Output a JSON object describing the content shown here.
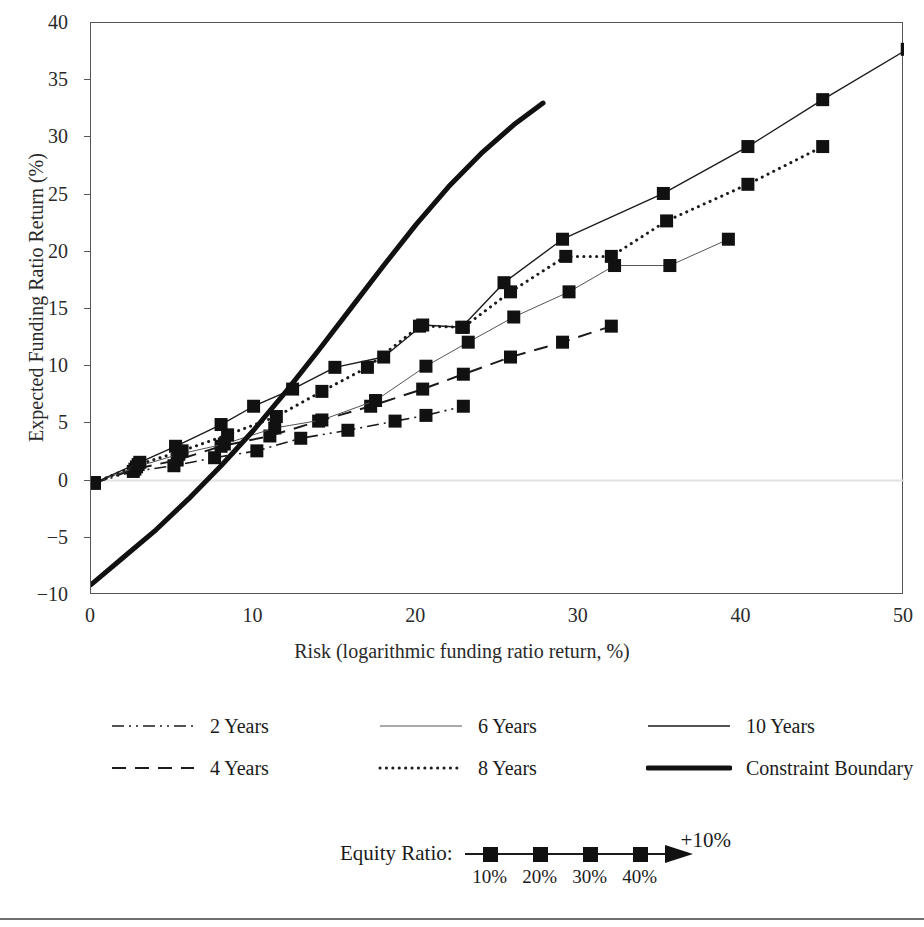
{
  "chart_data": {
    "type": "line",
    "title": "",
    "xlabel": "Risk (logarithmic funding ratio return, %)",
    "ylabel": "Expected Funding Ratio Return (%)",
    "xlim": [
      0,
      50
    ],
    "ylim": [
      -10,
      40
    ],
    "xticks": [
      0,
      10,
      20,
      30,
      40,
      50
    ],
    "yticks": [
      -10,
      -5,
      0,
      5,
      10,
      15,
      20,
      25,
      30,
      35,
      40
    ],
    "grid": false,
    "legend_position": "below-axes",
    "marker": "filled-square",
    "series": [
      {
        "name": "2 Years",
        "style": "dash-dot-dot",
        "color": "#1b1b1b",
        "width": 1.6,
        "markers": true,
        "points": [
          [
            0.2,
            -0.2
          ],
          [
            2.6,
            0.8
          ],
          [
            5.1,
            1.3
          ],
          [
            7.6,
            2.0
          ],
          [
            10.2,
            2.6
          ],
          [
            12.9,
            3.7
          ],
          [
            15.8,
            4.4
          ],
          [
            18.7,
            5.2
          ],
          [
            20.6,
            5.7
          ],
          [
            22.9,
            6.5
          ]
        ]
      },
      {
        "name": "4 Years",
        "style": "dashed",
        "color": "#1b1b1b",
        "width": 2.0,
        "markers": true,
        "points": [
          [
            0.2,
            -0.2
          ],
          [
            2.7,
            1.0
          ],
          [
            5.3,
            1.8
          ],
          [
            8.0,
            3.0
          ],
          [
            11.0,
            3.9
          ],
          [
            14.0,
            5.2
          ],
          [
            17.2,
            6.5
          ],
          [
            20.4,
            8.0
          ],
          [
            22.9,
            9.3
          ],
          [
            25.8,
            10.8
          ],
          [
            29.0,
            12.1
          ],
          [
            32.0,
            13.5
          ]
        ]
      },
      {
        "name": "6 Years",
        "style": "solid-thin",
        "color": "#555555",
        "width": 1.0,
        "markers": true,
        "points": [
          [
            0.2,
            -0.2
          ],
          [
            2.8,
            1.2
          ],
          [
            5.4,
            2.3
          ],
          [
            8.2,
            3.2
          ],
          [
            11.3,
            4.6
          ],
          [
            14.2,
            5.3
          ],
          [
            17.5,
            7.0
          ],
          [
            20.6,
            10.0
          ],
          [
            23.2,
            12.1
          ],
          [
            26.0,
            14.3
          ],
          [
            29.4,
            16.5
          ],
          [
            32.2,
            18.8
          ],
          [
            35.6,
            18.8
          ],
          [
            39.2,
            21.1
          ]
        ]
      },
      {
        "name": "8 Years",
        "style": "dotted",
        "color": "#1b1b1b",
        "width": 3.0,
        "markers": true,
        "points": [
          [
            0.2,
            -0.2
          ],
          [
            2.9,
            1.4
          ],
          [
            5.6,
            2.6
          ],
          [
            8.4,
            4.0
          ],
          [
            11.4,
            5.6
          ],
          [
            14.2,
            7.8
          ],
          [
            17.0,
            9.9
          ],
          [
            20.2,
            13.5
          ],
          [
            22.9,
            13.4
          ],
          [
            25.8,
            16.5
          ],
          [
            29.2,
            19.6
          ],
          [
            32.0,
            19.6
          ],
          [
            35.4,
            22.7
          ],
          [
            40.4,
            25.9
          ],
          [
            45.0,
            29.2
          ]
        ]
      },
      {
        "name": "10 Years",
        "style": "solid",
        "color": "#1b1b1b",
        "width": 1.4,
        "markers": true,
        "points": [
          [
            0.2,
            -0.2
          ],
          [
            3.0,
            1.6
          ],
          [
            5.2,
            3.0
          ],
          [
            8.0,
            4.9
          ],
          [
            10.0,
            6.5
          ],
          [
            12.4,
            8.0
          ],
          [
            15.0,
            9.9
          ],
          [
            18.0,
            10.8
          ],
          [
            20.4,
            13.6
          ],
          [
            22.8,
            13.4
          ],
          [
            25.4,
            17.3
          ],
          [
            29.0,
            21.1
          ],
          [
            35.2,
            25.1
          ],
          [
            40.4,
            29.2
          ],
          [
            45.0,
            33.3
          ],
          [
            50.2,
            37.7
          ]
        ]
      },
      {
        "name": "Constraint Boundary",
        "style": "solid-thick",
        "color": "#111111",
        "width": 5.0,
        "markers": false,
        "points": [
          [
            0.0,
            -9.1
          ],
          [
            2.0,
            -6.7
          ],
          [
            4.0,
            -4.3
          ],
          [
            6.0,
            -1.6
          ],
          [
            8.0,
            1.3
          ],
          [
            10.0,
            4.4
          ],
          [
            12.0,
            7.8
          ],
          [
            14.0,
            11.4
          ],
          [
            16.0,
            15.1
          ],
          [
            18.0,
            18.8
          ],
          [
            20.0,
            22.4
          ],
          [
            22.0,
            25.7
          ],
          [
            24.0,
            28.6
          ],
          [
            26.0,
            31.1
          ],
          [
            27.8,
            33.0
          ]
        ]
      }
    ]
  },
  "legend": {
    "rows": [
      [
        {
          "label": "2 Years",
          "style": "dash-dot-dot"
        },
        {
          "label": "6 Years",
          "style": "solid-thin"
        },
        {
          "label": "10 Years",
          "style": "solid"
        }
      ],
      [
        {
          "label": "4 Years",
          "style": "dashed"
        },
        {
          "label": "8 Years",
          "style": "dotted"
        },
        {
          "label": "Constraint Boundary",
          "style": "solid-thick"
        }
      ]
    ]
  },
  "equity_note": {
    "label": "Equity Ratio:",
    "ticks": [
      "10%",
      "20%",
      "30%",
      "40%"
    ],
    "arrow_label": "+10%"
  }
}
